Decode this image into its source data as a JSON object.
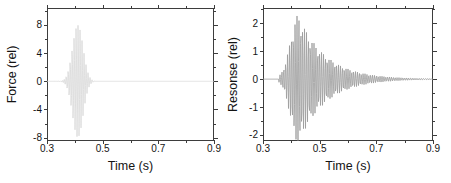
{
  "figure": {
    "background": "#ffffff",
    "frame_color": "#3d3d3d",
    "text_color": "#141414"
  },
  "chart_data": [
    {
      "id": "force",
      "type": "line",
      "title": "",
      "xlabel": "Time (s)",
      "ylabel": "Force (rel)",
      "xlim": [
        0.3,
        0.9
      ],
      "ylim": [
        -8.4,
        10.4
      ],
      "xtick_labels": [
        "0.3",
        "0.5",
        "0.7",
        "0.9"
      ],
      "xtick_values": [
        0.3,
        0.5,
        0.7,
        0.9
      ],
      "xminor_values": [
        0.4,
        0.6,
        0.8
      ],
      "ytick_labels": [
        "8",
        "4",
        "0",
        "-4",
        "-8"
      ],
      "ytick_values": [
        8,
        4,
        0,
        -4,
        -8
      ],
      "yminor_values": [
        10,
        6,
        2,
        -2,
        -6
      ],
      "grid": false,
      "legend": null,
      "line_color": "#d8d8d8",
      "signal": {
        "kind": "gaussian_tone_burst",
        "description": "flat zero baseline with a Gaussian-windowed sine burst",
        "baseline": 0,
        "center_s": 0.41,
        "sigma_s": 0.019,
        "frequency_hz": 140,
        "peak_amplitude": 8.5
      }
    },
    {
      "id": "response",
      "type": "line",
      "title": "",
      "xlabel": "Time (s)",
      "ylabel": "Resonse (rel)",
      "xlim": [
        0.3,
        0.9
      ],
      "ylim": [
        -2.2,
        2.55
      ],
      "xtick_labels": [
        "0.3",
        "0.5",
        "0.7",
        "0.9"
      ],
      "xtick_values": [
        0.3,
        0.5,
        0.7,
        0.9
      ],
      "xminor_values": [
        0.4,
        0.6,
        0.8
      ],
      "ytick_labels": [
        "2",
        "1",
        "0",
        "-1",
        "-2"
      ],
      "ytick_values": [
        2,
        1,
        0,
        -1,
        -2
      ],
      "yminor_values": [
        2.5,
        1.5,
        0.5,
        -0.5,
        -1.5
      ],
      "grid": false,
      "legend": null,
      "line_color": "#9a9a9a",
      "signal": {
        "kind": "damped_resonance",
        "description": "oscillation rising sharply from ~0.36 s to peak ~2.3 at ~0.43 s then decaying exponentially to zero by ~0.8 s",
        "baseline": 0,
        "onset_s": 0.355,
        "peak_s": 0.425,
        "rise_sigma_s": 0.028,
        "decay_tau_s": 0.095,
        "frequency_hz": 150,
        "peak_amplitude": 2.3
      }
    }
  ]
}
